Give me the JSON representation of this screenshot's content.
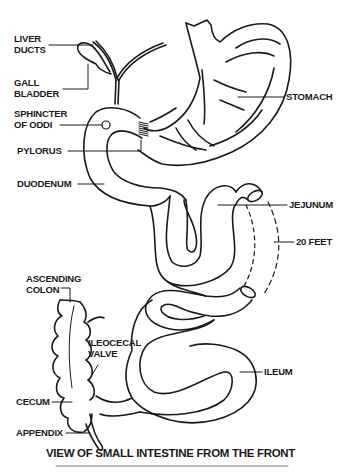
{
  "diagram": {
    "title": "VIEW OF SMALL INTESTINE FROM THE FRONT",
    "stroke_color": "#1a1a1a",
    "background": "#ffffff",
    "labels": {
      "liver_ducts": [
        "LIVER",
        "DUCTS"
      ],
      "gall_bladder": [
        "GALL",
        "BLADDER"
      ],
      "sphincter_of_oddi": [
        "SPHINCTER",
        "OF ODDI"
      ],
      "pylorus": "PYLORUS",
      "duodenum": "DUODENUM",
      "stomach": "STOMACH",
      "jejunum": "JEJUNUM",
      "length": "20 FEET",
      "ascending_colon": [
        "ASCENDING",
        "COLON"
      ],
      "ileocecal_valve": [
        "ILEOCECAL",
        "VALVE"
      ],
      "ileum": "ILEUM",
      "cecum": "CECUM",
      "appendix": "APPENDIX"
    }
  }
}
